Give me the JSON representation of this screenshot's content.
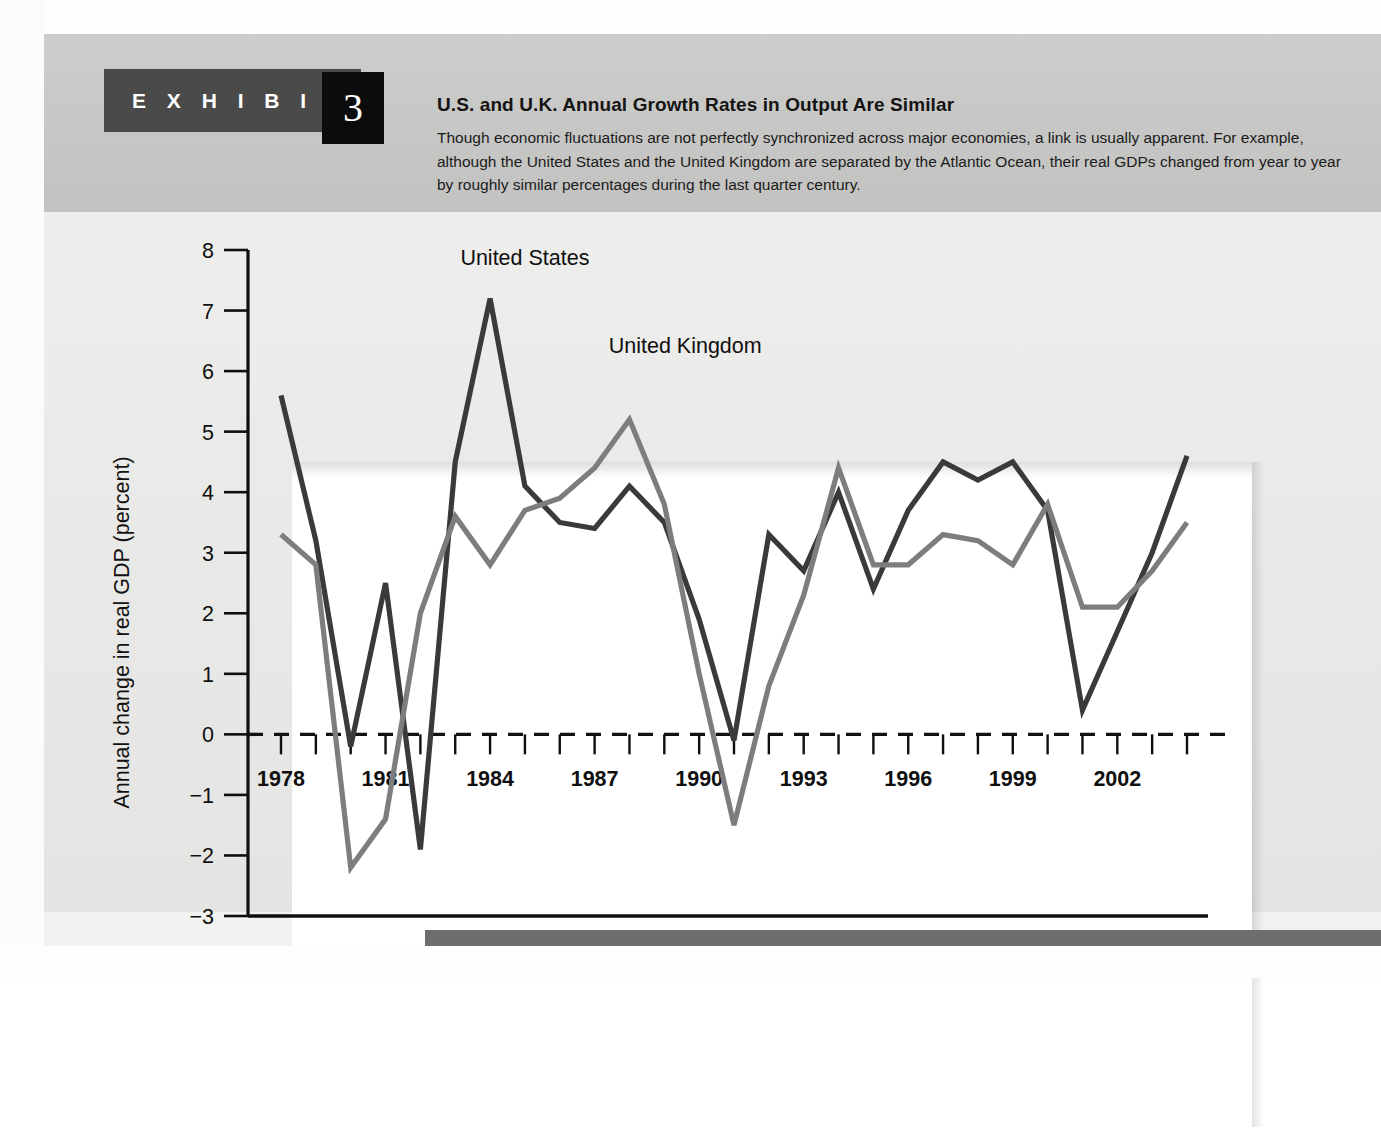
{
  "exhibit": {
    "word": "E X H I B I T",
    "number": "3"
  },
  "header": {
    "title": "U.S. and U.K. Annual Growth Rates in Output Are Similar",
    "description": "Though economic fluctuations are not perfectly synchronized across major economies, a link is usually apparent. For example, although the United States and the United Kingdom are separated by the Atlantic Ocean, their real GDPs changed from year to year by roughly similar percentages during the last quarter century."
  },
  "colors": {
    "united_states_line": "#3a3a3a",
    "united_kingdom_line": "#7d7d7d",
    "header_band": "#c9c9c7",
    "exhibit_tab": "#4a4a4a",
    "exhibit_number_box": "#0c0c0c",
    "panel_background": "#eaeae8",
    "plot_background": "#ffffff",
    "bottom_bar": "#6e6e6e"
  },
  "chart_data": {
    "type": "line",
    "title": "",
    "xlabel": "",
    "ylabel": "Annual change in real GDP (percent)",
    "xlim": [
      1978,
      2004
    ],
    "ylim": [
      -3,
      8
    ],
    "yticks": [
      8,
      7,
      6,
      5,
      4,
      3,
      2,
      1,
      0,
      -1,
      -2,
      -3
    ],
    "ytick_labels": [
      "8",
      "7",
      "6",
      "5",
      "4",
      "3",
      "2",
      "1",
      "0",
      "−1",
      "−2",
      "−3"
    ],
    "x": [
      1978,
      1979,
      1980,
      1981,
      1982,
      1983,
      1984,
      1985,
      1986,
      1987,
      1988,
      1989,
      1990,
      1991,
      1992,
      1993,
      1994,
      1995,
      1996,
      1997,
      1998,
      1999,
      2000,
      2001,
      2002,
      2003,
      2004
    ],
    "xticks": [
      1978,
      1979,
      1980,
      1981,
      1982,
      1983,
      1984,
      1985,
      1986,
      1987,
      1988,
      1989,
      1990,
      1991,
      1992,
      1993,
      1994,
      1995,
      1996,
      1997,
      1998,
      1999,
      2000,
      2001,
      2002,
      2003,
      2004
    ],
    "xtick_labels_shown": [
      "1978",
      "1981",
      "1984",
      "1987",
      "1990",
      "1993",
      "1996",
      "1999",
      "2002"
    ],
    "zero_line": 0,
    "zero_line_style": "dashed",
    "grid": false,
    "legend_position": "inline-annotation",
    "series": [
      {
        "name": "United States",
        "color": "#3a3a3a",
        "label_x": 1985.0,
        "label_y": 7.75,
        "values": [
          5.6,
          3.2,
          -0.2,
          2.5,
          -1.9,
          4.5,
          7.2,
          4.1,
          3.5,
          3.4,
          4.1,
          3.5,
          1.9,
          -0.1,
          3.3,
          2.7,
          4.0,
          2.4,
          3.7,
          4.5,
          4.2,
          4.5,
          3.7,
          0.4,
          1.7,
          3.0,
          4.6
        ]
      },
      {
        "name": "United Kingdom",
        "color": "#7d7d7d",
        "label_x": 1989.6,
        "label_y": 6.3,
        "values": [
          3.3,
          2.8,
          -2.2,
          -1.4,
          2.0,
          3.6,
          2.8,
          3.7,
          3.9,
          4.4,
          5.2,
          3.8,
          1.0,
          -1.5,
          0.8,
          2.3,
          4.4,
          2.8,
          2.8,
          3.3,
          3.2,
          2.8,
          3.8,
          2.1,
          2.1,
          2.7,
          3.5
        ]
      }
    ]
  }
}
